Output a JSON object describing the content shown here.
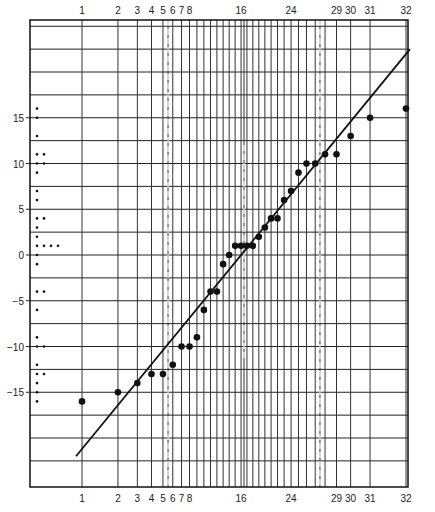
{
  "chart_data": {
    "type": "scatter",
    "subtype": "normal-probability-plot",
    "title": "",
    "xlabel": "",
    "ylabel": "",
    "n": 32,
    "x_tick_labels_top": [
      "1",
      "2",
      "3",
      "4",
      "5",
      "6",
      "7",
      "8",
      "16",
      "24",
      "29",
      "30",
      "31",
      "32"
    ],
    "x_tick_labels_bottom": [
      "1",
      "2",
      "3",
      "4",
      "5",
      "6",
      "7",
      "8",
      "16",
      "24",
      "29",
      "30",
      "31",
      "32"
    ],
    "x_tick_ranks": [
      1,
      2,
      3,
      4,
      5,
      6,
      7,
      8,
      16,
      24,
      29,
      30,
      31,
      32
    ],
    "dashed_ranks": [
      5.5,
      16.5,
      27.5
    ],
    "y_tick_labels": [
      "15",
      "10",
      "5",
      "0",
      "−5",
      "−10",
      "−15"
    ],
    "y_ticks": [
      15,
      10,
      5,
      0,
      -5,
      -10,
      -15
    ],
    "ylim": [
      -22.5,
      25
    ],
    "y_grid_step": 2.5,
    "grid": true,
    "points": {
      "ranks": [
        1,
        2,
        3,
        4,
        5,
        6,
        7,
        8,
        9,
        10,
        11,
        12,
        13,
        14,
        15,
        16,
        17,
        18,
        19,
        20,
        21,
        22,
        23,
        24,
        25,
        26,
        27,
        28,
        29,
        30,
        31,
        32
      ],
      "values": [
        -16,
        -15,
        -14,
        -13,
        -13,
        -12,
        -10,
        -10,
        -9,
        -6,
        -4,
        -4,
        -1,
        0,
        1,
        1,
        1,
        1,
        2,
        3,
        4,
        4,
        6,
        7,
        9,
        10,
        10,
        11,
        11,
        13,
        15,
        16
      ]
    },
    "fit_line": {
      "from": {
        "rank": 1,
        "value": -22
      },
      "to": {
        "rank": 32,
        "value": 22.5
      }
    },
    "dot_plot": {
      "description": "marginal dot plot of the same 32 values along the y axis",
      "values": [
        16,
        15,
        13,
        11,
        11,
        10,
        10,
        9,
        7,
        6,
        4,
        4,
        3,
        2,
        1,
        1,
        1,
        1,
        0,
        -1,
        -4,
        -4,
        -6,
        -9,
        -10,
        -10,
        -12,
        -13,
        -13,
        -14,
        -15,
        -16
      ]
    }
  }
}
